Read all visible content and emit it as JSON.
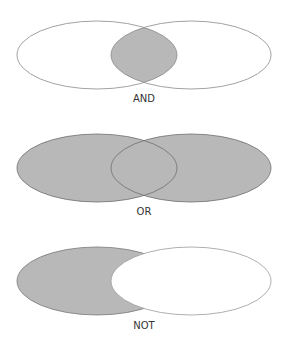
{
  "colors": {
    "fill": "#b8b8b8",
    "stroke": "#7a7a7a",
    "background": "#ffffff"
  },
  "diagrams": [
    {
      "label": "AND",
      "description": "intersection shaded"
    },
    {
      "label": "OR",
      "description": "union shaded"
    },
    {
      "label": "NOT",
      "description": "left set minus right set shaded"
    }
  ]
}
